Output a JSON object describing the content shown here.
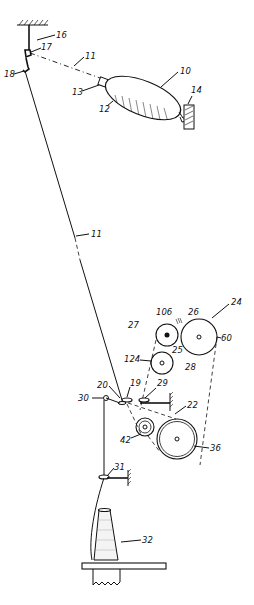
{
  "figure": {
    "type": "patent-drawing"
  },
  "labels": {
    "ref_10": "10",
    "ref_11_top": "11",
    "ref_11_mid": "11",
    "ref_12": "12",
    "ref_13": "13",
    "ref_14": "14",
    "ref_16": "16",
    "ref_17": "17",
    "ref_18": "18",
    "ref_19": "19",
    "ref_20": "20",
    "ref_22": "22",
    "ref_24": "24",
    "ref_25": "25",
    "ref_26": "26",
    "ref_27": "27",
    "ref_28": "28",
    "ref_29": "29",
    "ref_30": "30",
    "ref_31": "31",
    "ref_32": "32",
    "ref_36": "36",
    "ref_42": "42",
    "ref_60": "60",
    "ref_106": "106",
    "ref_124": "124"
  },
  "colors": {
    "ink": "#111111",
    "paper": "#ffffff"
  }
}
